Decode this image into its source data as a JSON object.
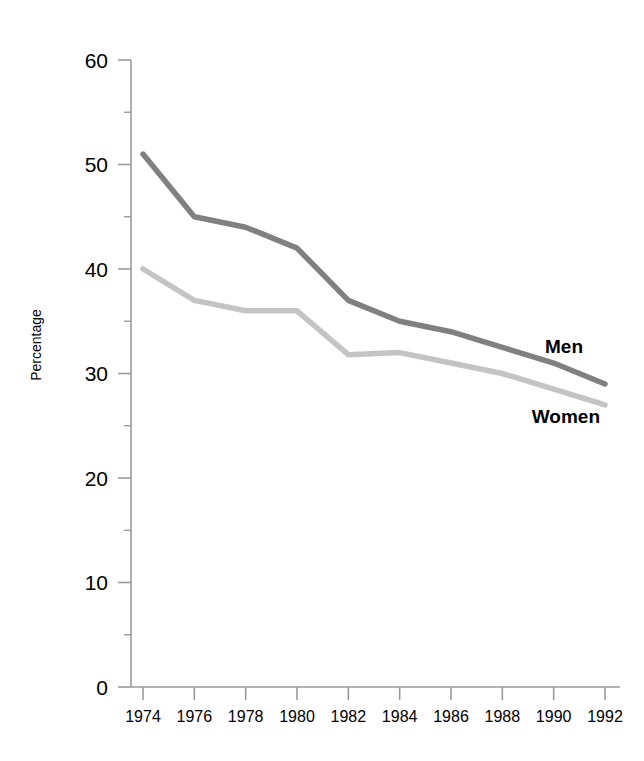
{
  "chart_data": {
    "type": "line",
    "title": "",
    "xlabel": "",
    "ylabel": "Percentage",
    "xlim": [
      1974,
      1992
    ],
    "ylim": [
      0,
      60
    ],
    "grid": false,
    "legend_position": "inline-right",
    "x": [
      1974,
      1976,
      1978,
      1980,
      1982,
      1984,
      1986,
      1988,
      1990,
      1992
    ],
    "xtick_labels": [
      "1974",
      "1976",
      "1978",
      "1980",
      "1982",
      "1984",
      "1986",
      "1988",
      "1990",
      "1992"
    ],
    "ytick_labels": [
      "0",
      "10",
      "20",
      "30",
      "40",
      "50",
      "60"
    ],
    "ytick_values": [
      0,
      10,
      20,
      30,
      40,
      50,
      60
    ],
    "yminor_values": [
      5,
      15,
      25,
      35,
      45,
      55
    ],
    "series": [
      {
        "name": "Men",
        "color": "#808080",
        "values": [
          51,
          45,
          44,
          42,
          37,
          35,
          34,
          32.5,
          31,
          29
        ]
      },
      {
        "name": "Women",
        "color": "#c4c4c4",
        "values": [
          40,
          37,
          36,
          36,
          31.8,
          32,
          31,
          30,
          28.5,
          27
        ]
      }
    ],
    "annotations": [
      {
        "text": "Men",
        "series": "Men"
      },
      {
        "text": "Women",
        "series": "Women"
      }
    ]
  }
}
